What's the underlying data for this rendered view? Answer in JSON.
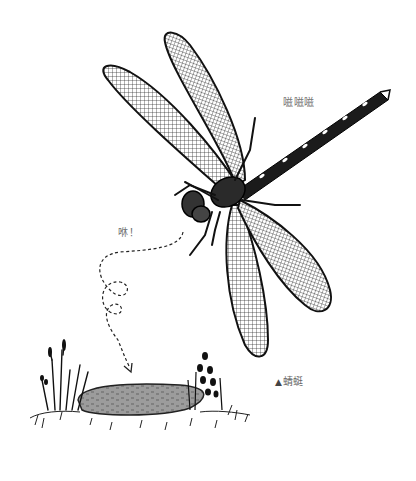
{
  "illustration": {
    "subject": "dragonfly",
    "style": "black-and-white pen-and-ink drawing",
    "elements": [
      "dragonfly",
      "dashed flight path",
      "pond",
      "reeds and grass"
    ]
  },
  "sound_effects": {
    "buzz": "嗞嗞嗞",
    "whoosh": "咻！"
  },
  "caption": {
    "marker": "▲",
    "text": "蜻蜓"
  },
  "colors": {
    "ink": "#111111",
    "pond": "#9a9a9a",
    "text": "#6f6f6f",
    "background": "#ffffff"
  }
}
